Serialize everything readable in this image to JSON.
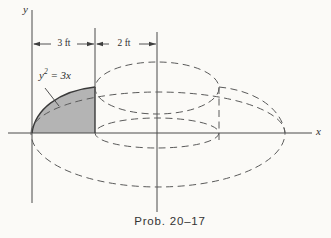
{
  "figure": {
    "caption": "Prob. 20–17",
    "axes": {
      "x_label": "x",
      "y_label": "y"
    },
    "dimensions": {
      "left_width": "3 ft",
      "right_width": "2 ft"
    },
    "equation": {
      "base": "y",
      "exponent": "2",
      "rhs": " = 3x"
    },
    "colors": {
      "background": "#fbfaf7",
      "shaded_region_fill": "#b4b4b4",
      "solid_line": "#4a4a4a",
      "dashed_line": "#5a5a5a"
    }
  }
}
